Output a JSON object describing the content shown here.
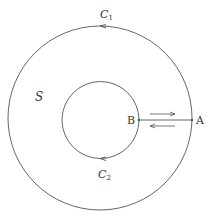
{
  "figure": {
    "outer_curve": {
      "label": "C",
      "subscript": "1",
      "direction": "counterclockwise"
    },
    "inner_curve": {
      "label": "C",
      "subscript": "2",
      "direction": "clockwise"
    },
    "region": {
      "label": "S"
    },
    "points": [
      {
        "label": "A"
      },
      {
        "label": "B"
      }
    ],
    "colors": {
      "stroke": "#555555",
      "text": "#333333",
      "background": "#ffffff"
    }
  }
}
